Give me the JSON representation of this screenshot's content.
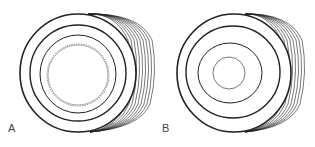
{
  "figures": [
    {
      "id": "A",
      "label": "A",
      "description": "vessel cross-section with folded (wavy) inner lining"
    },
    {
      "id": "B",
      "label": "B",
      "description": "vessel cross-section with smooth inner lining"
    }
  ],
  "colors": {
    "stroke": "#222222",
    "background": "#ffffff"
  }
}
